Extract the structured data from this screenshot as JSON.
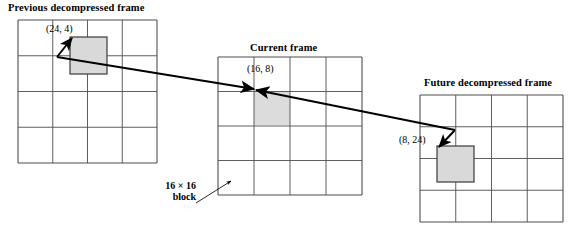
{
  "figure": {
    "type": "diagram",
    "background_color": "#ffffff",
    "line_color": "#000000",
    "grid_line_color": "#4d4d4d",
    "block_fill_color": "#d9d9d9",
    "cell_fill_color": "#dcdcdc"
  },
  "frames": [
    {
      "id": "previous",
      "title": "Previous decompressed frame",
      "grid": {
        "cols": 4,
        "rows": 4,
        "x": 18,
        "y": 20,
        "w": 139,
        "h": 143
      },
      "block": {
        "label": "(24, 4)",
        "x": 70,
        "y": 37,
        "w": 37,
        "h": 37
      }
    },
    {
      "id": "current",
      "title": "Current frame",
      "grid": {
        "cols": 4,
        "rows": 4,
        "x": 218,
        "y": 57,
        "w": 144,
        "h": 138
      },
      "block": {
        "label": "(16, 8)",
        "x": 254,
        "y": 91,
        "w": 36,
        "h": 34
      }
    },
    {
      "id": "future",
      "title": "Future decompressed frame",
      "grid": {
        "cols": 4,
        "rows": 4,
        "x": 420,
        "y": 95,
        "w": 143,
        "h": 127
      },
      "block": {
        "label": "(8, 24)",
        "x": 437,
        "y": 146,
        "w": 37,
        "h": 36
      }
    }
  ],
  "annotation": {
    "block_size_line1": "16 × 16",
    "block_size_line2": "block"
  },
  "vectors": [
    {
      "name": "previous-to-current-motion-vector",
      "from": [
        57,
        57
      ],
      "to": [
        254,
        89
      ],
      "arrowhead": "end"
    },
    {
      "name": "future-to-current-motion-vector",
      "from": [
        455,
        130
      ],
      "to": [
        256,
        90
      ],
      "arrowhead": "end"
    },
    {
      "name": "previous-block-pointer",
      "from": [
        57,
        57
      ],
      "to": [
        72,
        38
      ],
      "arrowhead": "end"
    },
    {
      "name": "future-block-pointer",
      "from": [
        455,
        130
      ],
      "to": [
        439,
        147
      ],
      "arrowhead": "end"
    },
    {
      "name": "block-size-pointer",
      "from": [
        196,
        203
      ],
      "to": [
        231,
        181
      ],
      "arrowhead": "end"
    }
  ]
}
